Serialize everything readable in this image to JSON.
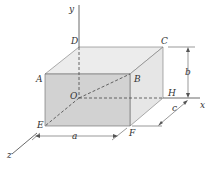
{
  "diagram": {
    "type": "rectangular box on 3D axes",
    "axes": {
      "x": "x",
      "y": "y",
      "z": "z"
    },
    "points": {
      "A": "A",
      "B": "B",
      "C": "C",
      "D": "D",
      "E": "E",
      "F": "F",
      "H": "H",
      "O": "O"
    },
    "dimensions": {
      "a": "a",
      "b": "b",
      "c": "c"
    },
    "colors": {
      "front_face": "#d0d0d0",
      "top_face": "#ececec",
      "side_face": "#e4e4e4",
      "line": "#444444"
    }
  }
}
